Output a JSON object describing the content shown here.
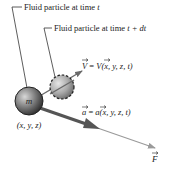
{
  "diagram": {
    "labels": {
      "particle_t": "Fluid particle at time ",
      "particle_t_var": "t",
      "particle_tdt": "Fluid particle at time ",
      "particle_tdt_var": "t + dt",
      "mass": "m",
      "position": "(x, y, z)",
      "velocity_lhs": "V",
      "velocity_eq": " = ",
      "velocity_rhs": "V",
      "velocity_args": "(x, y, z, t)",
      "accel_lhs": "a",
      "accel_eq": " = ",
      "accel_rhs": "a",
      "accel_args": "(x, y, z, t)",
      "force": "F"
    },
    "colors": {
      "sphere_dark": "#3a3a3a",
      "sphere_light": "#bdbdbd",
      "arrow_dark": "#555555",
      "arrow_light": "#9a9a9a",
      "leader": "#333333"
    }
  }
}
